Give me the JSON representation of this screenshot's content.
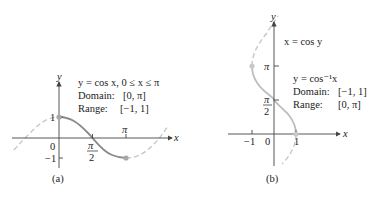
{
  "figure": {
    "panel_a": {
      "caption": "(a)",
      "equation": "y = cos x, 0 ≤ x ≤ π",
      "domain_label": "Domain:",
      "domain_value": "[0, π]",
      "range_label": "Range:",
      "range_value": "[−1, 1]",
      "axis_x": "x",
      "axis_y": "y",
      "tick_y_top": "1",
      "tick_y_bottom": "−1",
      "origin": "0",
      "tick_pi_half_num": "π",
      "tick_pi_half_den": "2",
      "tick_pi": "π"
    },
    "panel_b": {
      "caption": "(b)",
      "curve_label": "x = cos y",
      "equation": "y = cos⁻¹x",
      "domain_label": "Domain:",
      "domain_value": "[−1, 1]",
      "range_label": "Range:",
      "range_value": "[0, π]",
      "axis_x": "x",
      "axis_y": "y",
      "tick_x_neg": "−1",
      "origin": "0",
      "tick_x_pos": "1",
      "tick_pi": "π",
      "tick_pi_half_num": "π",
      "tick_pi_half_den": "2"
    },
    "colors": {
      "axis": "#444444",
      "solid_curve_a": "#8a8a8a",
      "solid_curve_b": "#bdbdbd",
      "dashed_curve": "#c4c4c4",
      "point": "#a8a8a8"
    }
  }
}
